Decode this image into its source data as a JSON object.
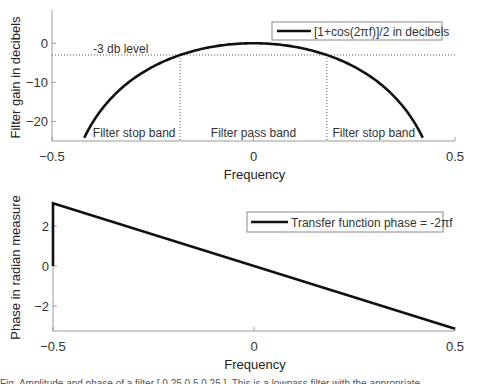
{
  "chart_data": [
    {
      "type": "line",
      "title": "",
      "xlabel": "Frequency",
      "ylabel": "Filter gain in decibels",
      "xlim": [
        -0.5,
        0.5
      ],
      "ylim": [
        -25,
        8.5
      ],
      "xticks": [
        -0.5,
        0,
        0.5
      ],
      "xtick_labels": [
        "−0.5",
        "0",
        "0.5"
      ],
      "yticks": [
        0,
        -10,
        -20
      ],
      "ytick_labels": [
        "0",
        "−10",
        "−20"
      ],
      "grid": false,
      "legend": {
        "position": "top-right",
        "entries": [
          "[1+cos(2πf)]/2 in decibels"
        ]
      },
      "series": [
        {
          "name": "[1+cos(2πf)]/2 in decibels",
          "function": "20*log10((1+cos(2*pi*f))/2)",
          "x": [
            -0.42,
            -0.4,
            -0.35,
            -0.3,
            -0.25,
            -0.2,
            -0.182,
            -0.15,
            -0.1,
            -0.05,
            0,
            0.05,
            0.1,
            0.15,
            0.182,
            0.2,
            0.25,
            0.3,
            0.35,
            0.4,
            0.42
          ],
          "y": [
            -24.2,
            -20.3,
            -14.5,
            -10.8,
            -6.0,
            -3.9,
            -3.0,
            -1.95,
            -0.84,
            -0.21,
            0,
            -0.21,
            -0.84,
            -1.95,
            -3.0,
            -3.9,
            -6.0,
            -10.8,
            -14.5,
            -20.3,
            -24.2
          ]
        }
      ],
      "annotations": {
        "minus3db_label": "-3 db level",
        "minus3db_value": -3,
        "cutoff_frequencies": [
          -0.182,
          0.182
        ],
        "bands": [
          "Filter stop band",
          "Filter pass band",
          "Filter stop band"
        ]
      }
    },
    {
      "type": "line",
      "title": "",
      "xlabel": "Frequency",
      "ylabel": "Phase in radian measure",
      "xlim": [
        -0.5,
        0.5
      ],
      "ylim": [
        -3.25,
        3.3
      ],
      "xticks": [
        -0.5,
        0,
        0.5
      ],
      "xtick_labels": [
        "−0.5",
        "0",
        "0.5"
      ],
      "yticks": [
        2,
        0,
        -2
      ],
      "ytick_labels": [
        "2",
        "0",
        "−2"
      ],
      "grid": false,
      "legend": {
        "position": "top-right",
        "entries": [
          "Transfer function phase = -2πf"
        ]
      },
      "series": [
        {
          "name": "Transfer function phase = -2πf",
          "x": [
            -0.5,
            -0.5,
            0.5
          ],
          "y": [
            0,
            3.1416,
            -3.1416
          ]
        }
      ]
    }
  ],
  "caption_text": "Fig. Amplitude and phase of a filter  [ 0.25   0.5   0.25 ].  This is a lowpass filter with the appropriate ..."
}
